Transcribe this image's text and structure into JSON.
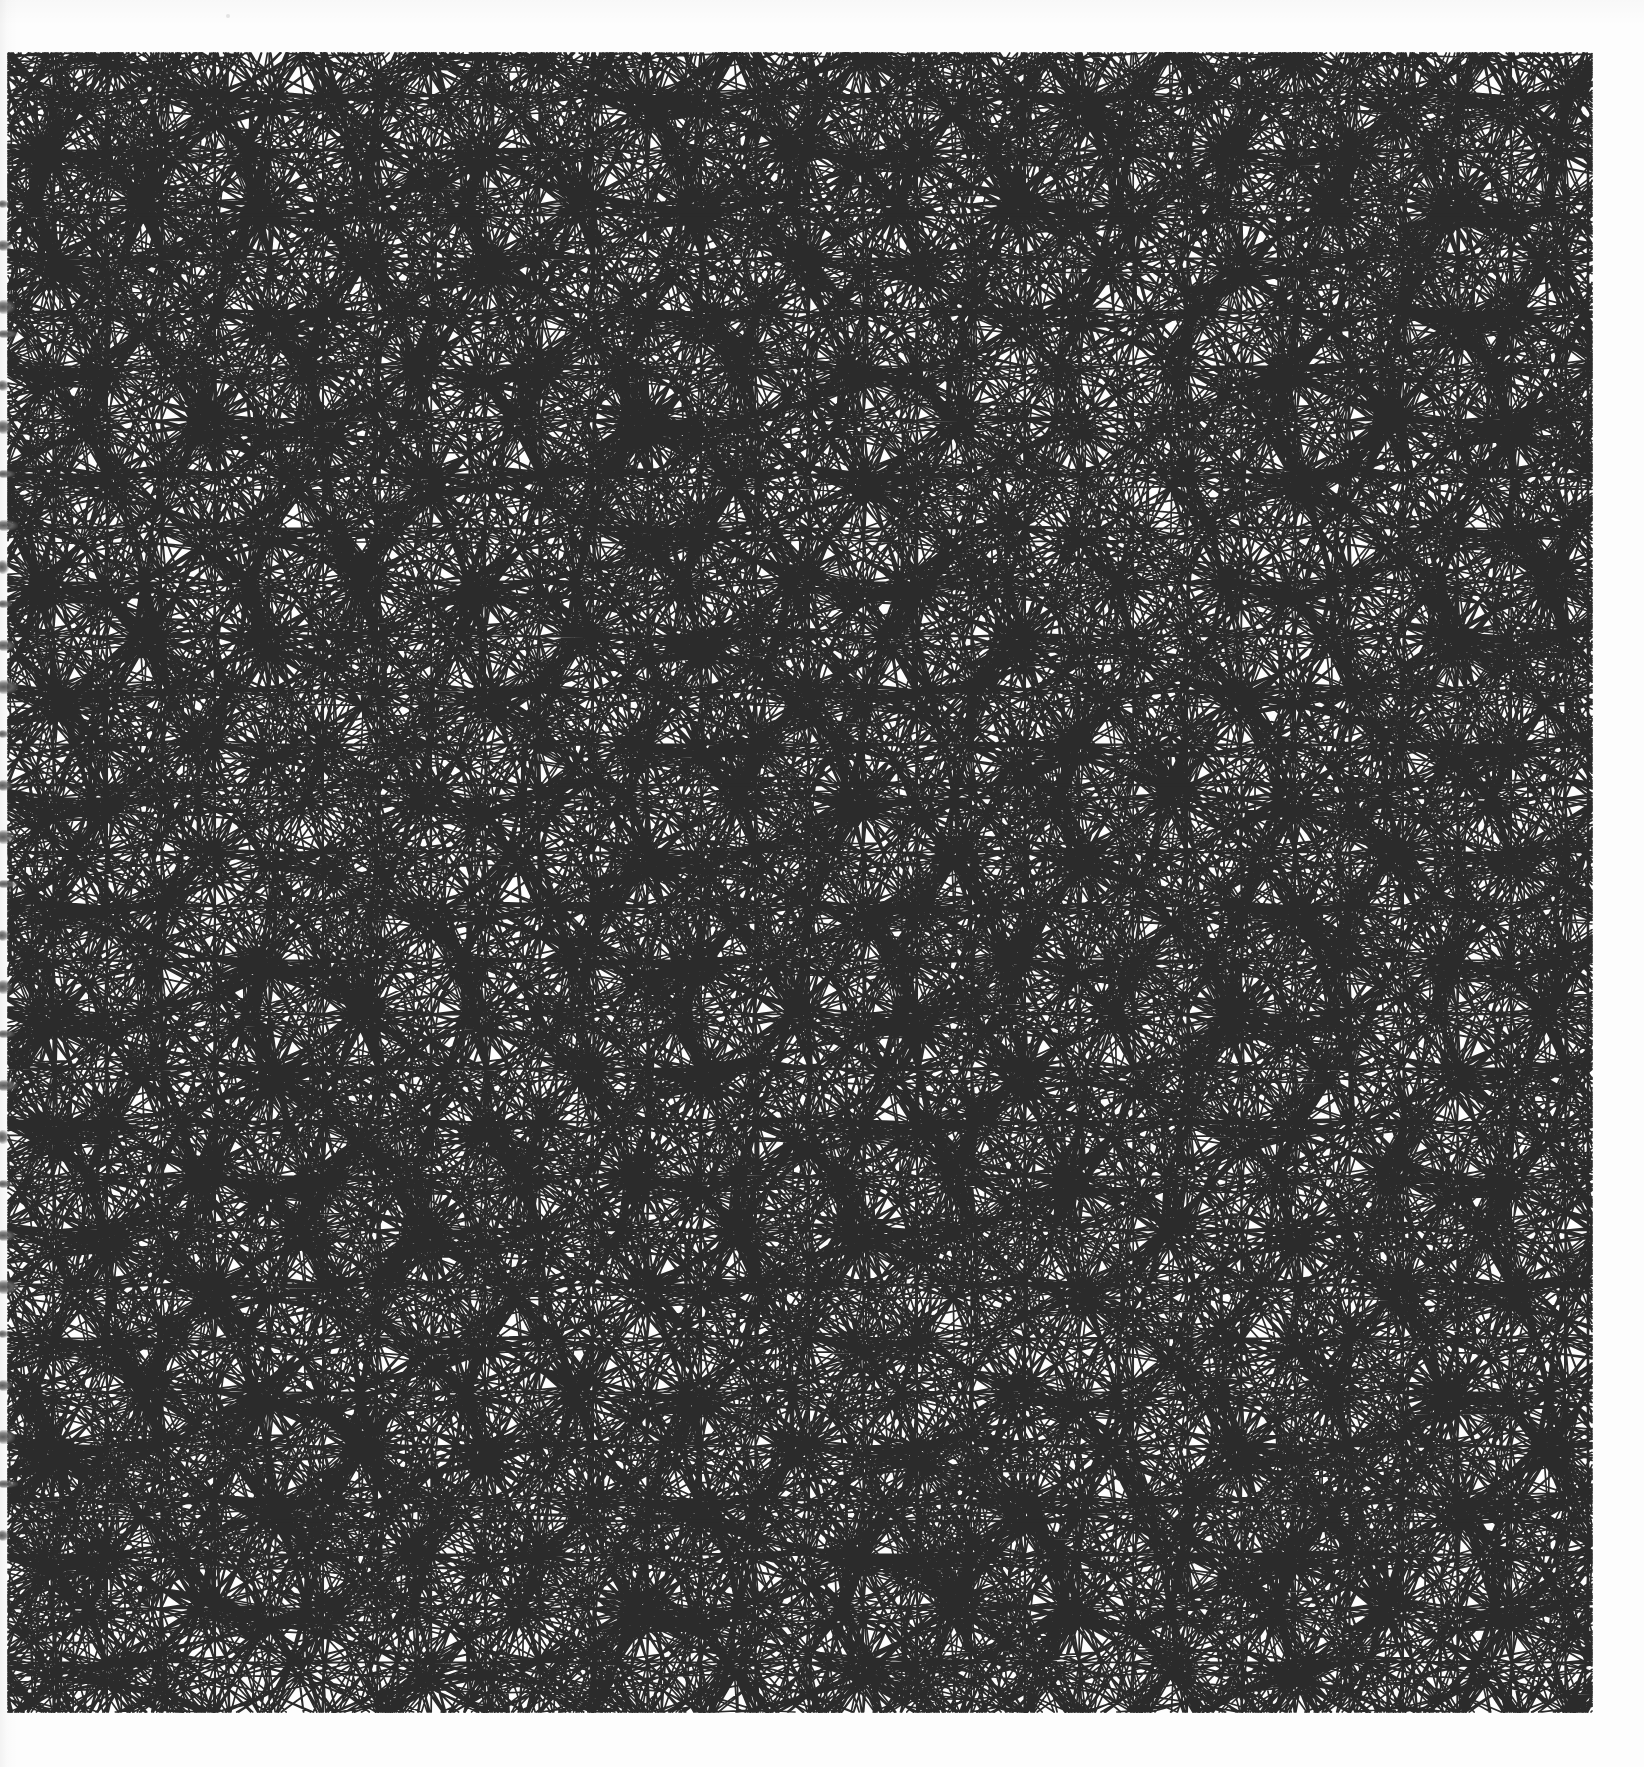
{
  "document": {
    "kind": "scanned-sketchbook-page",
    "title": "Quasi-periodic girih tiling study",
    "medium": "ink line drawing on white paper",
    "page_width": 1644,
    "page_height": 1767
  },
  "canvas": {
    "background_color": "#fdfdfd",
    "paper_tint": "#fefefe",
    "drawing_bounds": {
      "left": 8,
      "top": 53,
      "right": 1592,
      "bottom": 1712
    }
  },
  "artwork": {
    "name": "tiling-drawing",
    "line_color": "#2b2b2b",
    "line_width": 1.7,
    "heavy_line_width": 2.6,
    "style": "uncolored outline / coloring-book line art",
    "symmetry": "bilateral mirror about vertical axes and about the horizontal mid-line",
    "description": "Dense quasi-periodic line tiling built from rhombi, kites, pentagons and hexagons; twelve-fold star vertices repeat on a lattice; small square-centred rosettes sit on two horizontal bands."
  },
  "chart_data": {
    "type": "scatter",
    "title": "Quasi-periodic girih tiling study",
    "xlabel": "",
    "ylabel": "",
    "xlim": [
      0,
      1644
    ],
    "ylim": [
      0,
      1767
    ],
    "grid": false,
    "legend": "none",
    "lattice": {
      "cell_width": 637,
      "cell_height": 653,
      "origin_x": 60,
      "origin_y": 215,
      "columns": 4,
      "rows": 4
    },
    "star_vertices": [
      [
        60,
        215
      ],
      [
        700,
        215
      ],
      [
        1340,
        215
      ],
      [
        60,
        868
      ],
      [
        380,
        542
      ],
      [
        1020,
        542
      ],
      [
        1340,
        868
      ],
      [
        700,
        868
      ],
      [
        380,
        1194
      ],
      [
        1020,
        1194
      ],
      [
        60,
        1521
      ],
      [
        700,
        1521
      ],
      [
        1340,
        1521
      ],
      [
        380,
        215
      ],
      [
        1020,
        215
      ],
      [
        380,
        868
      ],
      [
        1020,
        868
      ],
      [
        380,
        1521
      ],
      [
        1020,
        1521
      ],
      [
        700,
        542
      ],
      [
        700,
        1194
      ]
    ],
    "rosette_centres": [
      [
        60,
        215
      ],
      [
        700,
        215
      ],
      [
        1340,
        215
      ],
      [
        380,
        785
      ],
      [
        1020,
        785
      ],
      [
        60,
        1521
      ],
      [
        700,
        1521
      ],
      [
        1340,
        1521
      ]
    ],
    "rule_lines": [
      {
        "y": 215,
        "x0": 8,
        "x1": 1592
      },
      {
        "y": 785,
        "x0": 8,
        "x1": 1592
      },
      {
        "y": 1521,
        "x0": 8,
        "x1": 1592
      }
    ],
    "border_lines": [
      {
        "x": 1588,
        "y0": 120,
        "y1": 1660
      }
    ]
  },
  "scan_artifacts": {
    "name": "binding-shadow",
    "edge": "left",
    "mark_color": "#3a3a3a",
    "marks_y": [
      200,
      240,
      300,
      330,
      380,
      420,
      470,
      520,
      560,
      600,
      640,
      680,
      730,
      780,
      830,
      880,
      930,
      980,
      1030,
      1080,
      1130,
      1180,
      1230,
      1280,
      1330,
      1380,
      1430,
      1480,
      1530
    ],
    "specks": [
      {
        "x": 226,
        "y": 14,
        "size": 4
      },
      {
        "x": 1014,
        "y": 75,
        "size": 3
      }
    ]
  }
}
